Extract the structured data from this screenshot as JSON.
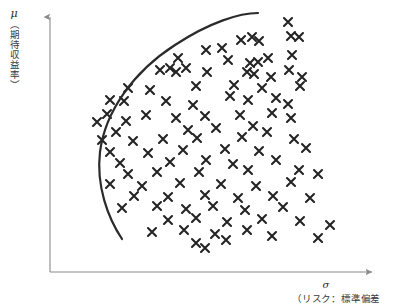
{
  "figure": {
    "axis_color": "#8a8a8a",
    "curve_color": "#2b2b2b",
    "marker_color": "#232323",
    "background": "#ffffff"
  },
  "axes": {
    "y": {
      "symbol": "μ",
      "label_jp": "（期待収益率）",
      "arrow": "up-arrow"
    },
    "x": {
      "symbol": "σ",
      "label_jp": "（リスク：標準偏差",
      "arrow": "right-arrow"
    }
  },
  "chart_data": {
    "type": "scatter",
    "title": "",
    "xlabel": "σ （リスク：標準偏差）",
    "ylabel": "μ （期待収益率）",
    "grid": false,
    "legend": "none",
    "xlim": [
      50,
      394
    ],
    "ylim": [
      0,
      272
    ],
    "marker": "x",
    "marker_size": 8,
    "points": [
      [
        259,
        41
      ],
      [
        288,
        22
      ],
      [
        291,
        36
      ],
      [
        299,
        37
      ],
      [
        241,
        40
      ],
      [
        252,
        37
      ],
      [
        206,
        50
      ],
      [
        222,
        48
      ],
      [
        178,
        58
      ],
      [
        228,
        60
      ],
      [
        250,
        63
      ],
      [
        258,
        62
      ],
      [
        268,
        58
      ],
      [
        292,
        55
      ],
      [
        160,
        70
      ],
      [
        170,
        68
      ],
      [
        176,
        72
      ],
      [
        186,
        68
      ],
      [
        207,
        72
      ],
      [
        247,
        72
      ],
      [
        254,
        74
      ],
      [
        289,
        70
      ],
      [
        271,
        77
      ],
      [
        302,
        77
      ],
      [
        128,
        88
      ],
      [
        150,
        90
      ],
      [
        196,
        86
      ],
      [
        234,
        85
      ],
      [
        262,
        88
      ],
      [
        300,
        86
      ],
      [
        110,
        100
      ],
      [
        124,
        101
      ],
      [
        166,
        101
      ],
      [
        230,
        96
      ],
      [
        193,
        105
      ],
      [
        248,
        100
      ],
      [
        276,
        98
      ],
      [
        288,
        104
      ],
      [
        107,
        114
      ],
      [
        146,
        115
      ],
      [
        97,
        122
      ],
      [
        126,
        121
      ],
      [
        176,
        118
      ],
      [
        205,
        116
      ],
      [
        240,
        115
      ],
      [
        272,
        113
      ],
      [
        291,
        118
      ],
      [
        116,
        132
      ],
      [
        188,
        130
      ],
      [
        216,
        128
      ],
      [
        253,
        126
      ],
      [
        267,
        132
      ],
      [
        102,
        140
      ],
      [
        133,
        141
      ],
      [
        163,
        139
      ],
      [
        197,
        138
      ],
      [
        242,
        137
      ],
      [
        294,
        139
      ],
      [
        110,
        152
      ],
      [
        148,
        153
      ],
      [
        183,
        150
      ],
      [
        225,
        149
      ],
      [
        259,
        151
      ],
      [
        306,
        148
      ],
      [
        120,
        163
      ],
      [
        170,
        162
      ],
      [
        206,
        160
      ],
      [
        233,
        164
      ],
      [
        276,
        160
      ],
      [
        128,
        174
      ],
      [
        157,
        172
      ],
      [
        199,
        172
      ],
      [
        248,
        170
      ],
      [
        299,
        170
      ],
      [
        318,
        174
      ],
      [
        110,
        184
      ],
      [
        142,
        186
      ],
      [
        180,
        183
      ],
      [
        221,
        184
      ],
      [
        256,
        186
      ],
      [
        291,
        182
      ],
      [
        134,
        196
      ],
      [
        168,
        197
      ],
      [
        205,
        195
      ],
      [
        238,
        198
      ],
      [
        273,
        196
      ],
      [
        310,
        198
      ],
      [
        122,
        208
      ],
      [
        157,
        206
      ],
      [
        186,
        209
      ],
      [
        213,
        206
      ],
      [
        245,
        210
      ],
      [
        283,
        207
      ],
      [
        168,
        220
      ],
      [
        196,
        218
      ],
      [
        227,
        222
      ],
      [
        262,
        219
      ],
      [
        300,
        221
      ],
      [
        330,
        225
      ],
      [
        152,
        232
      ],
      [
        184,
        230
      ],
      [
        215,
        234
      ],
      [
        247,
        230
      ],
      [
        272,
        236
      ],
      [
        318,
        238
      ],
      [
        196,
        243
      ],
      [
        226,
        240
      ],
      [
        205,
        248
      ]
    ],
    "frontier_curve": {
      "description": "efficient-frontier",
      "path": "M 122 239 C 108 218, 96 186, 100 152 C 105 112, 133 72, 175 45 C 210 22, 240 13, 258 13",
      "stroke_width": 2.2
    }
  }
}
